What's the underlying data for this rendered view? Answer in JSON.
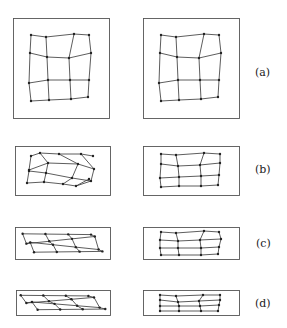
{
  "figure": {
    "width": 287,
    "height": 328,
    "stroke_color": "#333333",
    "rows": [
      {
        "label": "(a)",
        "label_pos": [
          262,
          76
        ],
        "left_box": [
          13,
          18,
          96,
          100
        ],
        "right_box": [
          143,
          18,
          96,
          100
        ],
        "left_grid": [
          [
            [
              31,
              35
            ],
            [
              46,
              37
            ],
            [
              74,
              34
            ],
            [
              89,
              35
            ]
          ],
          [
            [
              30,
              53
            ],
            [
              47,
              57
            ],
            [
              69,
              58
            ],
            [
              91,
              53
            ]
          ],
          [
            [
              29,
              83
            ],
            [
              48,
              80
            ],
            [
              70,
              80
            ],
            [
              89,
              80
            ]
          ],
          [
            [
              31,
              101
            ],
            [
              49,
              100
            ],
            [
              71,
              99
            ],
            [
              88,
              97
            ]
          ]
        ],
        "right_grid": [
          [
            [
              161,
              35
            ],
            [
              176,
              37
            ],
            [
              204,
              34
            ],
            [
              219,
              35
            ]
          ],
          [
            [
              160,
              53
            ],
            [
              177,
              57
            ],
            [
              199,
              58
            ],
            [
              221,
              53
            ]
          ],
          [
            [
              159,
              83
            ],
            [
              178,
              80
            ],
            [
              200,
              80
            ],
            [
              219,
              80
            ]
          ],
          [
            [
              161,
              101
            ],
            [
              179,
              100
            ],
            [
              201,
              99
            ],
            [
              218,
              97
            ]
          ]
        ]
      },
      {
        "label": "(b)",
        "label_pos": [
          262,
          172
        ],
        "left_box": [
          15,
          146,
          95,
          49
        ],
        "right_box": [
          143,
          146,
          96,
          49
        ],
        "left_grid": [
          [
            [
              31,
              156
            ],
            [
              40,
              153
            ],
            [
              59,
              154
            ],
            [
              81,
              154
            ],
            [
              93,
              156
            ]
          ],
          [
            [
              29,
              170
            ],
            [
              48,
              163
            ],
            [],
            [
              78,
              164
            ],
            [
              94,
              169
            ]
          ],
          [
            [
              29,
              171
            ],
            [
              46,
              173
            ],
            [
              72,
              178
            ],
            [
              91,
              181
            ]
          ],
          [
            [
              27,
              183
            ],
            [
              44,
              182
            ],
            [
              63,
              184
            ],
            [
              76,
              186
            ],
            [
              89,
              179
            ]
          ]
        ],
        "right_grid": [
          [
            [
              161,
              154
            ],
            [
              176,
              155
            ],
            [
              204,
              153
            ],
            [
              220,
              154
            ]
          ],
          [
            [
              161,
              164
            ],
            [
              178,
              166
            ],
            [
              200,
              165
            ],
            [
              220,
              163
            ]
          ],
          [
            [
              160,
              178
            ],
            [
              179,
              177
            ],
            [
              201,
              176
            ],
            [
              219,
              175
            ]
          ],
          [
            [
              161,
              187
            ],
            [
              179,
              186
            ],
            [
              201,
              186
            ],
            [
              218,
              185
            ]
          ]
        ]
      },
      {
        "label": "(c)",
        "label_pos": [
          262,
          247
        ],
        "left_box": [
          15,
          227,
          95,
          32
        ],
        "right_box": [
          143,
          227,
          96,
          32
        ],
        "right_grid": [
          [
            [
              161,
              232
            ],
            [
              176,
              233
            ],
            [
              204,
              231
            ],
            [
              219,
              232
            ]
          ],
          [
            [
              160,
              240
            ],
            [
              178,
              241
            ],
            [
              200,
              240
            ],
            [
              221,
              239
            ]
          ],
          [
            [
              160,
              248
            ],
            [
              178,
              248
            ],
            [
              201,
              248
            ],
            [
              219,
              247
            ]
          ],
          [
            [
              161,
              255
            ],
            [
              179,
              255
            ],
            [
              201,
              255
            ],
            [
              218,
              254
            ]
          ]
        ]
      },
      {
        "label": "(d)",
        "label_pos": [
          262,
          307
        ],
        "left_box": [
          16,
          290,
          94,
          25
        ],
        "right_box": [
          143,
          290,
          96,
          25
        ],
        "right_grid": [
          [
            [
              160,
              295
            ],
            [
              176,
              296
            ],
            [
              203,
              295
            ],
            [
              220,
              295
            ]
          ],
          [
            [
              160,
              300
            ],
            [
              178,
              302
            ],
            [
              199,
              301
            ],
            [
              220,
              300
            ]
          ],
          [
            [
              160,
              306
            ],
            [
              179,
              306
            ],
            [
              200,
              306
            ],
            [
              219,
              305
            ]
          ],
          [
            [
              160,
              311
            ],
            [
              179,
              311
            ],
            [
              201,
              311
            ],
            [
              218,
              311
            ]
          ]
        ]
      }
    ]
  },
  "labels": {
    "a": "(a)",
    "b": "(b)",
    "c": "(c)",
    "d": "(d)"
  }
}
